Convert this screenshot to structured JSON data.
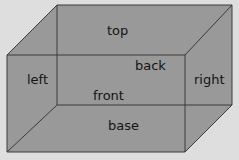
{
  "diagram": {
    "kind": "cuboid-net-faces",
    "background_color": "#dedede",
    "face_fill_color": "#999999",
    "edge_color": "#3a3a3a",
    "label_color": "#141414",
    "edge_width": 1,
    "labels": [
      {
        "id": "top",
        "text": "top",
        "x": 123,
        "y": 31,
        "face": "top-face"
      },
      {
        "id": "back",
        "text": "back",
        "x": 153,
        "y": 66,
        "face": "back-face"
      },
      {
        "id": "left",
        "text": "left",
        "x": 39,
        "y": 80,
        "face": "left-face"
      },
      {
        "id": "right",
        "text": "right",
        "x": 210,
        "y": 80,
        "face": "right-face"
      },
      {
        "id": "front",
        "text": "front",
        "x": 113,
        "y": 96,
        "face": "front-face"
      },
      {
        "id": "base",
        "text": "base",
        "x": 124,
        "y": 126,
        "face": "base-face"
      }
    ],
    "vertices": {
      "back_top_left": [
        57,
        5
      ],
      "back_top_right": [
        232,
        5
      ],
      "back_bottom_right": [
        232,
        105
      ],
      "back_bottom_left": [
        57,
        105
      ],
      "front_top_left": [
        7,
        55
      ],
      "front_top_right": [
        185,
        55
      ],
      "front_bottom_right": [
        185,
        152
      ],
      "front_bottom_left": [
        7,
        152
      ]
    },
    "polygons": {
      "silhouette": "7,55 57,5 232,5 232,105 185,152 7,152",
      "top_face": "7,55 57,5 232,5 185,55",
      "back_face": "57,5 232,5 232,105 57,105",
      "left_face": "7,55 57,5 57,105 7,152",
      "right_face": "185,55 232,5 232,105 185,152",
      "front_face": "7,55 185,55 185,152 7,152",
      "base_face": "7,152 57,105 232,105 185,152"
    },
    "edges": [
      {
        "name": "back-top",
        "from": [
          57,
          5
        ],
        "to": [
          232,
          5
        ]
      },
      {
        "name": "back-right",
        "from": [
          232,
          5
        ],
        "to": [
          232,
          105
        ]
      },
      {
        "name": "back-bottom",
        "from": [
          57,
          105
        ],
        "to": [
          232,
          105
        ]
      },
      {
        "name": "back-left",
        "from": [
          57,
          5
        ],
        "to": [
          57,
          105
        ]
      },
      {
        "name": "front-top",
        "from": [
          7,
          55
        ],
        "to": [
          185,
          55
        ]
      },
      {
        "name": "front-right",
        "from": [
          185,
          55
        ],
        "to": [
          185,
          152
        ]
      },
      {
        "name": "front-bottom",
        "from": [
          7,
          152
        ],
        "to": [
          185,
          152
        ]
      },
      {
        "name": "front-left",
        "from": [
          7,
          55
        ],
        "to": [
          7,
          152
        ]
      },
      {
        "name": "connector-top-left",
        "from": [
          7,
          55
        ],
        "to": [
          57,
          5
        ]
      },
      {
        "name": "connector-top-right",
        "from": [
          185,
          55
        ],
        "to": [
          232,
          5
        ]
      },
      {
        "name": "connector-bottom-right",
        "from": [
          185,
          152
        ],
        "to": [
          232,
          105
        ]
      },
      {
        "name": "connector-bottom-left",
        "from": [
          7,
          152
        ],
        "to": [
          57,
          105
        ]
      }
    ]
  }
}
